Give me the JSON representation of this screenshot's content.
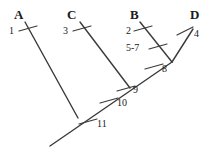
{
  "figure": {
    "kind": "cladogram",
    "background_color": "#ffffff",
    "line_color": "#3a3a3a",
    "text_color": "#1a1a1a",
    "width": 209,
    "height": 148
  },
  "taxa": [
    {
      "id": "A",
      "label": "A",
      "x": 14,
      "y": 8
    },
    {
      "id": "C",
      "label": "C",
      "x": 67,
      "y": 8
    },
    {
      "id": "B",
      "label": "B",
      "x": 130,
      "y": 8
    },
    {
      "id": "D",
      "label": "D",
      "x": 190,
      "y": 8
    }
  ],
  "character_marks": [
    {
      "id": "m1",
      "label": "1",
      "x": 9,
      "y": 26
    },
    {
      "id": "m3",
      "label": "3",
      "x": 63,
      "y": 26
    },
    {
      "id": "m2",
      "label": "2",
      "x": 126,
      "y": 26
    },
    {
      "id": "m4",
      "label": "4",
      "x": 194,
      "y": 29
    },
    {
      "id": "m57",
      "label": "5-7",
      "x": 126,
      "y": 43
    },
    {
      "id": "m8",
      "label": "8",
      "x": 162,
      "y": 64
    },
    {
      "id": "m9",
      "label": "9",
      "x": 133,
      "y": 85
    },
    {
      "id": "m10",
      "label": "10",
      "x": 117,
      "y": 98
    },
    {
      "id": "m11",
      "label": "11",
      "x": 97,
      "y": 119
    }
  ],
  "branches": [
    {
      "id": "branch-A",
      "from": [
        25,
        22
      ],
      "to": [
        78,
        118
      ]
    },
    {
      "id": "branch-C",
      "from": [
        80,
        22
      ],
      "to": [
        130,
        88
      ]
    },
    {
      "id": "branch-B",
      "from": [
        140,
        22
      ],
      "to": [
        172,
        62
      ]
    },
    {
      "id": "branch-D",
      "from": [
        193,
        29
      ],
      "to": [
        172,
        62
      ]
    },
    {
      "id": "branch-trunk",
      "from": [
        172,
        62
      ],
      "to": [
        50,
        146
      ]
    }
  ],
  "ticks": [
    {
      "id": "tick-1",
      "cx": 28,
      "cy": 28,
      "angle": -15
    },
    {
      "id": "tick-3",
      "cx": 82,
      "cy": 28,
      "angle": -15
    },
    {
      "id": "tick-2",
      "cx": 143,
      "cy": 28,
      "angle": -15
    },
    {
      "id": "tick-4",
      "cx": 185,
      "cy": 31,
      "angle": 20
    },
    {
      "id": "tick-5-7",
      "cx": 158,
      "cy": 46,
      "angle": -15
    },
    {
      "id": "tick-8",
      "cx": 154,
      "cy": 66,
      "angle": -15
    },
    {
      "id": "tick-9",
      "cx": 126,
      "cy": 88,
      "angle": -15
    },
    {
      "id": "tick-10",
      "cx": 109,
      "cy": 100,
      "angle": -15
    },
    {
      "id": "tick-11",
      "cx": 88,
      "cy": 121,
      "angle": -15
    }
  ]
}
